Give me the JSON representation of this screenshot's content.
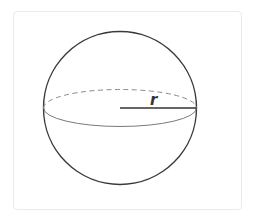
{
  "diagram": {
    "shape": "sphere",
    "radius_label": "r",
    "colors": {
      "outline": "#3a3a3a",
      "equator_back": "#8a8a8a",
      "equator_front": "#7a7a7a",
      "radius_line": "#333333",
      "label": "#333333",
      "card_border": "#ebebeb"
    }
  }
}
